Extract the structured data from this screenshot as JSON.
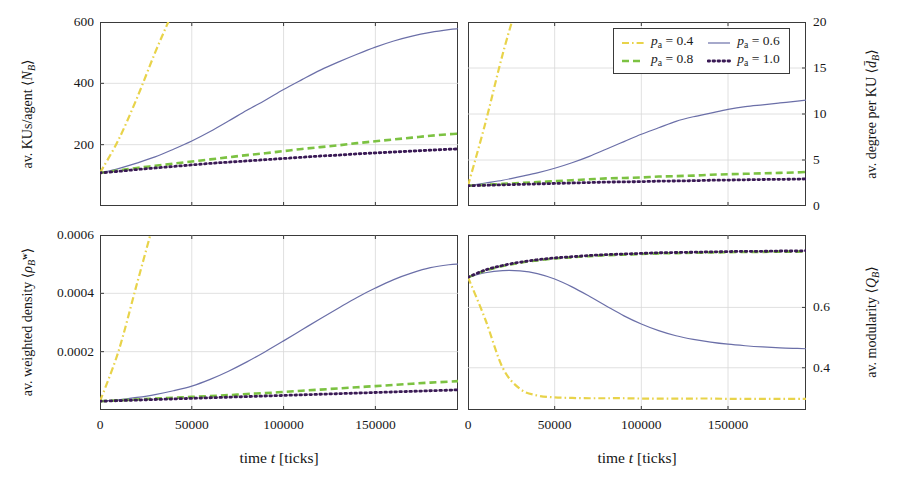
{
  "figure": {
    "type": "multi-panel-line-chart",
    "panels": 4,
    "layout": "2x2",
    "background": "#ffffff"
  },
  "colors": {
    "p04": "#e8d34a",
    "p06": "#6b6fa8",
    "p08": "#7cc242",
    "p10": "#3a1a55",
    "axis": "#3a3a3a",
    "grid": "#d8d8d8",
    "text": "#171717"
  },
  "legend": {
    "position": "top-right-panel",
    "entries": [
      {
        "label": "p_a = 0.4",
        "var": "p",
        "sub": "a",
        "value": "= 0.4",
        "color": "#e8d34a",
        "style": "dashdot"
      },
      {
        "label": "p_a = 0.6",
        "var": "p",
        "sub": "a",
        "value": "= 0.6",
        "color": "#6b6fa8",
        "style": "solid"
      },
      {
        "label": "p_a = 0.8",
        "var": "p",
        "sub": "a",
        "value": "= 0.8",
        "color": "#7cc242",
        "style": "dashed"
      },
      {
        "label": "p_a = 1.0",
        "var": "p",
        "sub": "a",
        "value": "= 1.0",
        "color": "#3a1a55",
        "style": "dotted"
      }
    ]
  },
  "xaxis": {
    "label_prefix": "time ",
    "label_var": "t",
    "label_suffix": " [ticks]",
    "label_full": "time t [ticks]",
    "ticks": [
      0,
      50000,
      100000,
      150000
    ],
    "tick_labels": [
      "0",
      "50000",
      "100000",
      "150000"
    ],
    "range": [
      0,
      195000
    ]
  },
  "chart_data": [
    {
      "id": "top-left",
      "type": "line",
      "title": "",
      "ylabel": "av. KUs/agent ⟨N_B⟩",
      "ylabel_prefix": "av. KUs/agent ",
      "ylabel_var": "N",
      "ylabel_sub": "B",
      "xlabel": "time t [ticks]",
      "ylim": [
        0,
        600
      ],
      "xlim": [
        0,
        195000
      ],
      "yticks": [
        200,
        400,
        600
      ],
      "ytick_labels": [
        "200",
        "400",
        "600"
      ],
      "yaxis_side": "left",
      "grid": true,
      "x": [
        0,
        10000,
        20000,
        30000,
        40000,
        50000,
        60000,
        70000,
        80000,
        90000,
        100000,
        110000,
        120000,
        130000,
        140000,
        150000,
        160000,
        170000,
        180000,
        190000,
        195000
      ],
      "series": [
        {
          "name": "p_a = 0.4",
          "color": "#e8d34a",
          "style": "dashdot",
          "values": [
            108,
            215,
            350,
            500,
            640,
            790,
            null,
            null,
            null,
            null,
            null,
            null,
            null,
            null,
            null,
            null,
            null,
            null,
            null,
            null,
            null
          ],
          "clipped_above": true
        },
        {
          "name": "p_a = 0.6",
          "color": "#6b6fa8",
          "style": "solid",
          "values": [
            108,
            122,
            140,
            160,
            185,
            212,
            243,
            277,
            312,
            345,
            380,
            412,
            443,
            470,
            495,
            518,
            538,
            554,
            566,
            575,
            578
          ]
        },
        {
          "name": "p_a = 0.8",
          "color": "#7cc242",
          "style": "dashed",
          "values": [
            108,
            116,
            124,
            131,
            138,
            145,
            152,
            159,
            166,
            172,
            179,
            186,
            192,
            198,
            205,
            211,
            217,
            223,
            229,
            234,
            236
          ]
        },
        {
          "name": "p_a = 1.0",
          "color": "#3a1a55",
          "style": "dotted",
          "values": [
            108,
            113,
            119,
            124,
            129,
            134,
            139,
            143,
            147,
            151,
            155,
            159,
            163,
            166,
            170,
            173,
            176,
            179,
            182,
            185,
            186
          ]
        }
      ]
    },
    {
      "id": "top-right",
      "type": "line",
      "title": "",
      "ylabel": "av. degree per KU ⟨d̄_B⟩",
      "ylabel_prefix": "av. degree per KU ",
      "ylabel_var": "d",
      "ylabel_sub": "B",
      "xlabel": "time t [ticks]",
      "ylim": [
        0,
        20
      ],
      "xlim": [
        0,
        195000
      ],
      "yticks": [
        0,
        5,
        10,
        15,
        20
      ],
      "ytick_labels": [
        "0",
        "5",
        "10",
        "15",
        "20"
      ],
      "yaxis_side": "right",
      "grid": true,
      "x": [
        0,
        10000,
        20000,
        30000,
        40000,
        50000,
        60000,
        70000,
        80000,
        90000,
        100000,
        110000,
        120000,
        130000,
        140000,
        150000,
        160000,
        170000,
        180000,
        190000,
        195000
      ],
      "series": [
        {
          "name": "p_a = 0.4",
          "color": "#e8d34a",
          "style": "dashdot",
          "values": [
            2.2,
            9.0,
            16.5,
            23.0,
            null,
            null,
            null,
            null,
            null,
            null,
            null,
            null,
            null,
            null,
            null,
            null,
            null,
            null,
            null,
            null,
            null
          ],
          "clipped_above": true
        },
        {
          "name": "p_a = 0.6",
          "color": "#6b6fa8",
          "style": "solid",
          "values": [
            2.2,
            2.5,
            2.8,
            3.2,
            3.6,
            4.1,
            4.7,
            5.4,
            6.2,
            7.0,
            7.8,
            8.5,
            9.2,
            9.7,
            10.1,
            10.5,
            10.8,
            11.0,
            11.2,
            11.4,
            11.5
          ]
        },
        {
          "name": "p_a = 0.8",
          "color": "#7cc242",
          "style": "dashed",
          "values": [
            2.2,
            2.3,
            2.4,
            2.5,
            2.6,
            2.7,
            2.8,
            2.9,
            3.0,
            3.05,
            3.1,
            3.2,
            3.25,
            3.3,
            3.4,
            3.45,
            3.5,
            3.55,
            3.6,
            3.65,
            3.7
          ]
        },
        {
          "name": "p_a = 1.0",
          "color": "#3a1a55",
          "style": "dotted",
          "values": [
            2.2,
            2.25,
            2.3,
            2.35,
            2.4,
            2.45,
            2.5,
            2.55,
            2.6,
            2.62,
            2.65,
            2.7,
            2.72,
            2.75,
            2.8,
            2.82,
            2.85,
            2.88,
            2.9,
            2.92,
            2.95
          ]
        }
      ]
    },
    {
      "id": "bottom-left",
      "type": "line",
      "title": "",
      "ylabel": "av. weighted density ⟨ρ_B^w⟩",
      "ylabel_prefix": "av. weighted density ",
      "ylabel_var": "ρ",
      "ylabel_sub": "B",
      "ylabel_sup": "w",
      "xlabel": "time t [ticks]",
      "ylim": [
        0,
        0.0006
      ],
      "xlim": [
        0,
        195000
      ],
      "yticks": [
        0.0002,
        0.0004,
        0.0006
      ],
      "ytick_labels": [
        "0.0002",
        "0.0004",
        "0.0006"
      ],
      "yaxis_side": "left",
      "grid": true,
      "x": [
        0,
        10000,
        20000,
        30000,
        40000,
        50000,
        60000,
        70000,
        80000,
        90000,
        100000,
        110000,
        120000,
        130000,
        140000,
        150000,
        160000,
        170000,
        180000,
        190000,
        195000
      ],
      "series": [
        {
          "name": "p_a = 0.4",
          "color": "#e8d34a",
          "style": "dashdot",
          "values": [
            3e-05,
            0.0002,
            0.00043,
            0.00066,
            null,
            null,
            null,
            null,
            null,
            null,
            null,
            null,
            null,
            null,
            null,
            null,
            null,
            null,
            null,
            null,
            null
          ],
          "clipped_above": true
        },
        {
          "name": "p_a = 0.6",
          "color": "#6b6fa8",
          "style": "solid",
          "values": [
            3e-05,
            3.5e-05,
            4.3e-05,
            5.3e-05,
            6.6e-05,
            8.2e-05,
            0.000105,
            0.000133,
            0.000165,
            0.0002,
            0.000237,
            0.000275,
            0.000313,
            0.00035,
            0.000386,
            0.000418,
            0.000447,
            0.00047,
            0.000488,
            0.000498,
            0.0005
          ]
        },
        {
          "name": "p_a = 0.8",
          "color": "#7cc242",
          "style": "dashed",
          "values": [
            3e-05,
            3.3e-05,
            3.6e-05,
            3.9e-05,
            4.2e-05,
            4.5e-05,
            4.8e-05,
            5.1e-05,
            5.5e-05,
            5.8e-05,
            6.2e-05,
            6.6e-05,
            7e-05,
            7.4e-05,
            7.8e-05,
            8.2e-05,
            8.6e-05,
            9e-05,
            9.4e-05,
            9.7e-05,
            9.9e-05
          ]
        },
        {
          "name": "p_a = 1.0",
          "color": "#3a1a55",
          "style": "dotted",
          "values": [
            3e-05,
            3.2e-05,
            3.4e-05,
            3.6e-05,
            3.8e-05,
            4e-05,
            4.2e-05,
            4.4e-05,
            4.6e-05,
            4.8e-05,
            5e-05,
            5.2e-05,
            5.4e-05,
            5.6e-05,
            5.8e-05,
            6e-05,
            6.2e-05,
            6.4e-05,
            6.6e-05,
            6.8e-05,
            6.9e-05
          ]
        }
      ]
    },
    {
      "id": "bottom-right",
      "type": "line",
      "title": "",
      "ylabel": "av. modularity ⟨Q_B⟩",
      "ylabel_prefix": "av. modularity ",
      "ylabel_var": "Q",
      "ylabel_sub": "B",
      "xlabel": "time t [ticks]",
      "ylim": [
        0.26,
        0.84
      ],
      "xlim": [
        0,
        195000
      ],
      "yticks": [
        0.4,
        0.6
      ],
      "ytick_labels": [
        "0.4",
        "0.6"
      ],
      "yaxis_side": "right",
      "grid": true,
      "x": [
        0,
        10000,
        20000,
        30000,
        40000,
        50000,
        60000,
        70000,
        80000,
        90000,
        100000,
        110000,
        120000,
        130000,
        140000,
        150000,
        160000,
        170000,
        180000,
        190000,
        195000
      ],
      "series": [
        {
          "name": "p_a = 0.4",
          "color": "#e8d34a",
          "style": "dashdot",
          "values": [
            0.7,
            0.56,
            0.4,
            0.33,
            0.308,
            0.302,
            0.3,
            0.299,
            0.299,
            0.299,
            0.298,
            0.298,
            0.298,
            0.298,
            0.298,
            0.297,
            0.297,
            0.297,
            0.297,
            0.297,
            0.297
          ]
        },
        {
          "name": "p_a = 0.6",
          "color": "#6b6fa8",
          "style": "solid",
          "values": [
            0.7,
            0.715,
            0.722,
            0.721,
            0.712,
            0.694,
            0.668,
            0.637,
            0.604,
            0.572,
            0.545,
            0.523,
            0.506,
            0.494,
            0.485,
            0.478,
            0.473,
            0.469,
            0.466,
            0.464,
            0.463
          ]
        },
        {
          "name": "p_a = 0.8",
          "color": "#7cc242",
          "style": "dashed",
          "values": [
            0.7,
            0.722,
            0.737,
            0.748,
            0.756,
            0.762,
            0.766,
            0.77,
            0.773,
            0.775,
            0.777,
            0.779,
            0.78,
            0.781,
            0.782,
            0.783,
            0.784,
            0.784,
            0.785,
            0.785,
            0.786
          ]
        },
        {
          "name": "p_a = 1.0",
          "color": "#3a1a55",
          "style": "dotted",
          "values": [
            0.7,
            0.724,
            0.739,
            0.75,
            0.758,
            0.764,
            0.768,
            0.772,
            0.775,
            0.777,
            0.779,
            0.781,
            0.782,
            0.783,
            0.784,
            0.785,
            0.786,
            0.786,
            0.787,
            0.787,
            0.788
          ]
        }
      ]
    }
  ]
}
